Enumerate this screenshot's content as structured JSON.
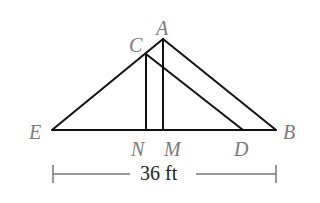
{
  "diagram": {
    "type": "geometry-triangles",
    "stroke_color": "#111111",
    "label_color": "#7a7a7a",
    "points": {
      "A": {
        "label": "A",
        "x": 163,
        "y": 39
      },
      "C": {
        "label": "C",
        "x": 146,
        "y": 54
      },
      "E": {
        "label": "E",
        "x": 52,
        "y": 130
      },
      "B": {
        "label": "B",
        "x": 276,
        "y": 130
      },
      "N": {
        "label": "N",
        "x": 146,
        "y": 130
      },
      "M": {
        "label": "M",
        "x": 163,
        "y": 130
      },
      "D": {
        "label": "D",
        "x": 243,
        "y": 130
      }
    },
    "segments": [
      [
        "E",
        "B"
      ],
      [
        "E",
        "A"
      ],
      [
        "A",
        "B"
      ],
      [
        "C",
        "D"
      ],
      [
        "C",
        "N"
      ],
      [
        "A",
        "M"
      ]
    ],
    "dimension": {
      "label": "36 ft",
      "from": "E",
      "to": "B",
      "y": 174
    }
  }
}
